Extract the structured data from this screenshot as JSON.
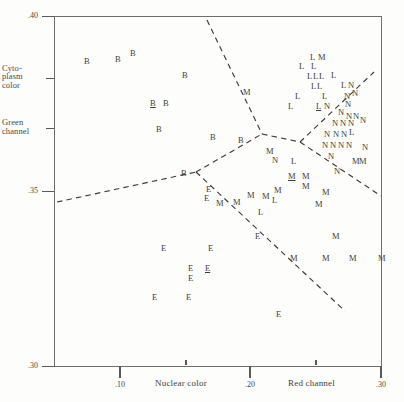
{
  "figure": {
    "type": "classification-scatter",
    "background": "#fdfdfc",
    "ink": "#3d3d3d"
  },
  "axes": {
    "y": {
      "numeric_ticks": [
        {
          "label": ".40",
          "value": 0.4,
          "y": 16
        },
        {
          "label": ".35",
          "value": 0.35,
          "y": 191
        },
        {
          "label": ".30",
          "value": 0.3,
          "y": 366
        }
      ],
      "named_ticks": [
        {
          "label": "Cyto-\nplasm\ncolor",
          "y": 78
        },
        {
          "label": "Green\nchannel",
          "y": 128
        }
      ],
      "range": [
        0.3,
        0.4
      ]
    },
    "x": {
      "numeric_ticks": [
        {
          "label": ".10",
          "value": 0.1,
          "x": 120
        },
        {
          "label": ".20",
          "value": 0.2,
          "x": 250
        },
        {
          "label": ".30",
          "value": 0.3,
          "x": 381
        }
      ],
      "minor_ticks": [
        186,
        316
      ],
      "named_labels": [
        {
          "label": "Nuclear color",
          "x": 155
        },
        {
          "label": "Red channel",
          "x": 288
        }
      ],
      "range": [
        0.055,
        0.3
      ]
    }
  },
  "chart_data": {
    "type": "scatter",
    "title": "",
    "xlabel": "Nuclear color / Red channel",
    "ylabel": "Cytoplasm color / Green channel",
    "xlim": [
      0.055,
      0.3
    ],
    "ylim": [
      0.3,
      0.4
    ],
    "grid": false,
    "legend": "none",
    "marker_encoding": "class letter",
    "classes": [
      "B",
      "E",
      "L",
      "M",
      "N"
    ],
    "note_underline": "underlined letters mark emphasized specimens",
    "points": [
      {
        "label": "B",
        "x": 84,
        "y": 57,
        "underline": false
      },
      {
        "label": "B",
        "x": 115,
        "y": 55,
        "underline": false
      },
      {
        "label": "B",
        "x": 130,
        "y": 49,
        "underline": false
      },
      {
        "label": "B",
        "x": 182,
        "y": 71,
        "underline": false
      },
      {
        "label": "B",
        "x": 150,
        "y": 99,
        "underline": true
      },
      {
        "label": "B",
        "x": 163,
        "y": 99,
        "underline": false
      },
      {
        "label": "B",
        "x": 156,
        "y": 125,
        "underline": false
      },
      {
        "label": "B",
        "x": 210,
        "y": 133,
        "underline": false
      },
      {
        "label": "B",
        "x": 238,
        "y": 136,
        "underline": false
      },
      {
        "label": "B",
        "x": 181,
        "y": 169,
        "underline": false
      },
      {
        "label": "M",
        "x": 243,
        "y": 88,
        "underline": false
      },
      {
        "label": "L",
        "x": 310,
        "y": 53,
        "underline": false
      },
      {
        "label": "M",
        "x": 318,
        "y": 53,
        "underline": false
      },
      {
        "label": "L",
        "x": 299,
        "y": 62,
        "underline": false
      },
      {
        "label": "L",
        "x": 311,
        "y": 62,
        "underline": false
      },
      {
        "label": "L",
        "x": 307,
        "y": 72,
        "underline": false
      },
      {
        "label": "L",
        "x": 313,
        "y": 72,
        "underline": false
      },
      {
        "label": "L",
        "x": 319,
        "y": 72,
        "underline": false
      },
      {
        "label": "L",
        "x": 331,
        "y": 71,
        "underline": false
      },
      {
        "label": "L",
        "x": 311,
        "y": 82,
        "underline": false
      },
      {
        "label": "L",
        "x": 317,
        "y": 82,
        "underline": false
      },
      {
        "label": "L",
        "x": 341,
        "y": 81,
        "underline": false
      },
      {
        "label": "N",
        "x": 348,
        "y": 81,
        "underline": false
      },
      {
        "label": "L",
        "x": 295,
        "y": 92,
        "underline": false
      },
      {
        "label": "L",
        "x": 322,
        "y": 92,
        "underline": false
      },
      {
        "label": "N",
        "x": 344,
        "y": 92,
        "underline": false
      },
      {
        "label": "N",
        "x": 352,
        "y": 89,
        "underline": false
      },
      {
        "label": "L",
        "x": 288,
        "y": 102,
        "underline": false
      },
      {
        "label": "L",
        "x": 316,
        "y": 102,
        "underline": true
      },
      {
        "label": "N",
        "x": 324,
        "y": 102,
        "underline": false
      },
      {
        "label": "N",
        "x": 345,
        "y": 100,
        "underline": false
      },
      {
        "label": "N",
        "x": 338,
        "y": 108,
        "underline": false
      },
      {
        "label": "N",
        "x": 346,
        "y": 112,
        "underline": false
      },
      {
        "label": "N",
        "x": 353,
        "y": 112,
        "underline": false
      },
      {
        "label": "N",
        "x": 332,
        "y": 119,
        "underline": false
      },
      {
        "label": "N",
        "x": 340,
        "y": 119,
        "underline": false
      },
      {
        "label": "N",
        "x": 348,
        "y": 119,
        "underline": false
      },
      {
        "label": "N",
        "x": 360,
        "y": 116,
        "underline": false
      },
      {
        "label": "N",
        "x": 324,
        "y": 130,
        "underline": false
      },
      {
        "label": "N",
        "x": 333,
        "y": 130,
        "underline": false
      },
      {
        "label": "N",
        "x": 341,
        "y": 130,
        "underline": false
      },
      {
        "label": "L",
        "x": 349,
        "y": 128,
        "underline": false
      },
      {
        "label": "N",
        "x": 322,
        "y": 141,
        "underline": false
      },
      {
        "label": "N",
        "x": 330,
        "y": 141,
        "underline": false
      },
      {
        "label": "N",
        "x": 338,
        "y": 141,
        "underline": false
      },
      {
        "label": "N",
        "x": 346,
        "y": 141,
        "underline": false
      },
      {
        "label": "N",
        "x": 362,
        "y": 143,
        "underline": false
      },
      {
        "label": "N",
        "x": 328,
        "y": 152,
        "underline": false
      },
      {
        "label": "M",
        "x": 352,
        "y": 157,
        "underline": false
      },
      {
        "label": "M",
        "x": 359,
        "y": 157,
        "underline": false
      },
      {
        "label": "N",
        "x": 334,
        "y": 167,
        "underline": false
      },
      {
        "label": "M",
        "x": 266,
        "y": 147,
        "underline": false
      },
      {
        "label": "N",
        "x": 272,
        "y": 156,
        "underline": false
      },
      {
        "label": "L",
        "x": 291,
        "y": 157,
        "underline": false
      },
      {
        "label": "M",
        "x": 288,
        "y": 172,
        "underline": true
      },
      {
        "label": "M",
        "x": 302,
        "y": 172,
        "underline": false
      },
      {
        "label": "M",
        "x": 302,
        "y": 182,
        "underline": false
      },
      {
        "label": "M",
        "x": 274,
        "y": 186,
        "underline": false
      },
      {
        "label": "M",
        "x": 262,
        "y": 192,
        "underline": false
      },
      {
        "label": "M",
        "x": 247,
        "y": 191,
        "underline": false
      },
      {
        "label": "L",
        "x": 272,
        "y": 196,
        "underline": false
      },
      {
        "label": "M",
        "x": 233,
        "y": 198,
        "underline": false
      },
      {
        "label": "M",
        "x": 216,
        "y": 199,
        "underline": false
      },
      {
        "label": "M",
        "x": 322,
        "y": 188,
        "underline": false
      },
      {
        "label": "M",
        "x": 315,
        "y": 200,
        "underline": false
      },
      {
        "label": "L",
        "x": 258,
        "y": 208,
        "underline": false
      },
      {
        "label": "E",
        "x": 206,
        "y": 185,
        "underline": false
      },
      {
        "label": "E",
        "x": 255,
        "y": 232,
        "underline": false
      },
      {
        "label": "M",
        "x": 332,
        "y": 232,
        "underline": false
      },
      {
        "label": "M",
        "x": 290,
        "y": 254,
        "underline": false
      },
      {
        "label": "M",
        "x": 322,
        "y": 254,
        "underline": false
      },
      {
        "label": "M",
        "x": 349,
        "y": 254,
        "underline": false
      },
      {
        "label": "M",
        "x": 378,
        "y": 254,
        "underline": false
      },
      {
        "label": "E",
        "x": 204,
        "y": 194,
        "underline": false
      },
      {
        "label": "E",
        "x": 161,
        "y": 244,
        "underline": false
      },
      {
        "label": "E",
        "x": 208,
        "y": 244,
        "underline": false
      },
      {
        "label": "E",
        "x": 188,
        "y": 264,
        "underline": false
      },
      {
        "label": "E",
        "x": 205,
        "y": 264,
        "underline": true
      },
      {
        "label": "E",
        "x": 188,
        "y": 274,
        "underline": false
      },
      {
        "label": "E",
        "x": 152,
        "y": 293,
        "underline": false
      },
      {
        "label": "E",
        "x": 186,
        "y": 293,
        "underline": false
      },
      {
        "label": "E",
        "x": 276,
        "y": 310,
        "underline": false
      }
    ],
    "boundaries": [
      {
        "name": "upper-left-separator",
        "x1": 207,
        "y1": 20,
        "x2": 262,
        "y2": 134
      },
      {
        "name": "left-horizontal-separator",
        "x1": 57,
        "y1": 202,
        "x2": 196,
        "y2": 172
      },
      {
        "name": "junction-link",
        "x1": 196,
        "y1": 172,
        "x2": 262,
        "y2": 134
      },
      {
        "name": "mid-link",
        "x1": 262,
        "y1": 134,
        "x2": 300,
        "y2": 142
      },
      {
        "name": "upper-right-separator",
        "x1": 300,
        "y1": 142,
        "x2": 374,
        "y2": 72
      },
      {
        "name": "right-descending-separator",
        "x1": 300,
        "y1": 142,
        "x2": 381,
        "y2": 196
      },
      {
        "name": "lower-diagonal-separator",
        "x1": 196,
        "y1": 172,
        "x2": 345,
        "y2": 311
      }
    ]
  }
}
